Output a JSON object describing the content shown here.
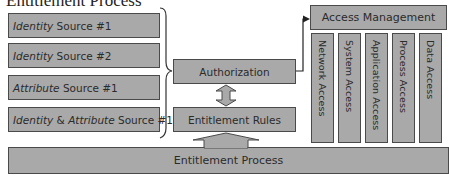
{
  "title": "Entitlement Process",
  "sources": [
    {
      "italic": "Identity",
      "rest": " Source #1"
    },
    {
      "italic": "Identity",
      "rest": " Source #2"
    },
    {
      "italic": "Attribute",
      "rest": " Source #1"
    },
    {
      "italic": "Identity",
      "mid": " & ",
      "italic2": "Attribute",
      "rest": " Source #1"
    }
  ],
  "authorization": "Authorization",
  "entitlement_rules": "Entitlement Rules",
  "entitlement_process": "Entitlement Process",
  "access_management": "Access Management",
  "access_types": [
    "Network Access",
    "System Access",
    "Application Access",
    "Process Access",
    "Data Access"
  ],
  "colors": {
    "box_fill": "#a9a9a9",
    "box_border": "#4a4a4a",
    "text": "#2b2b2b",
    "connector": "#222222"
  }
}
